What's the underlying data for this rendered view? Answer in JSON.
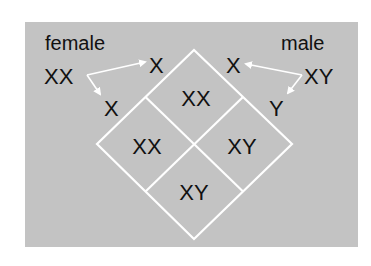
{
  "colors": {
    "panel": "#c3c3c3",
    "lines": "#ffffff",
    "text": "#111111",
    "background": "#ffffff"
  },
  "parents": {
    "female": {
      "label": "female",
      "genotype": "XX",
      "gametes": [
        "X",
        "X"
      ]
    },
    "male": {
      "label": "male",
      "genotype": "XY",
      "gametes": [
        "X",
        "Y"
      ]
    }
  },
  "punnett": {
    "cells": {
      "top": "XX",
      "left": "XX",
      "right": "XY",
      "bottom": "XY"
    }
  }
}
